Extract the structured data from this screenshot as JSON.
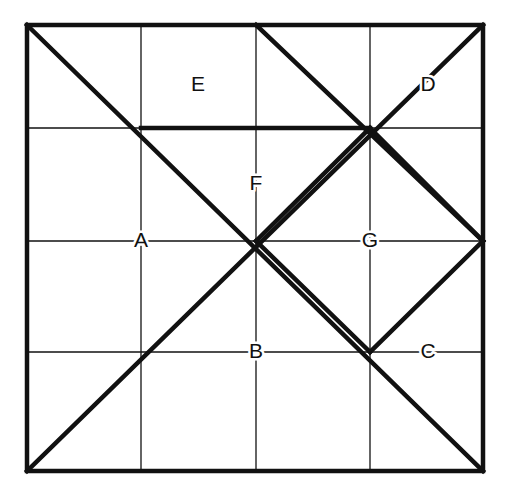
{
  "figure": {
    "colors": {
      "background": "#ffffff",
      "stroke": "#111111",
      "label": "#111111"
    },
    "canvas": {
      "width": 509,
      "height": 497
    },
    "square": {
      "left": 27,
      "top": 25,
      "right": 483,
      "bottom": 471,
      "border_width": 4.5
    },
    "grid": {
      "columns": 4,
      "rows": 4,
      "line_width": 1.3,
      "vertical_x": [
        141,
        256,
        370
      ],
      "horizontal_y": [
        128,
        241,
        352
      ]
    },
    "thick_line_width": 4.5,
    "labels": [
      {
        "id": "label-A",
        "text": "A",
        "x": 141,
        "y": 241
      },
      {
        "id": "label-B",
        "text": "B",
        "x": 256,
        "y": 352
      },
      {
        "id": "label-C",
        "text": "C",
        "x": 428,
        "y": 352
      },
      {
        "id": "label-D",
        "text": "D",
        "x": 428,
        "y": 85
      },
      {
        "id": "label-E",
        "text": "E",
        "x": 198,
        "y": 85
      },
      {
        "id": "label-F",
        "text": "F",
        "x": 256,
        "y": 184
      },
      {
        "id": "label-G",
        "text": "G",
        "x": 370,
        "y": 241
      }
    ],
    "thick_segments": [
      {
        "name": "diagonal-top-left-to-bottom-right",
        "x1": 27,
        "y1": 25,
        "x2": 483,
        "y2": 471
      },
      {
        "name": "diagonal-bottom-left-to-top-right",
        "x1": 27,
        "y1": 471,
        "x2": 483,
        "y2": 25
      },
      {
        "name": "diagonal-top-mid-to-right-mid",
        "x1": 256,
        "y1": 25,
        "x2": 483,
        "y2": 241
      },
      {
        "name": "horizontal-upper-thick",
        "x1": 141,
        "y1": 128,
        "x2": 370,
        "y2": 128
      },
      {
        "name": "diamond-upper-left-edge",
        "x1": 256,
        "y1": 241,
        "x2": 370,
        "y2": 128
      },
      {
        "name": "diamond-upper-right-edge",
        "x1": 370,
        "y1": 128,
        "x2": 483,
        "y2": 241
      },
      {
        "name": "diamond-lower-right-edge",
        "x1": 483,
        "y1": 241,
        "x2": 370,
        "y2": 352
      },
      {
        "name": "diamond-lower-left-edge",
        "x1": 370,
        "y1": 352,
        "x2": 256,
        "y2": 241
      }
    ]
  }
}
